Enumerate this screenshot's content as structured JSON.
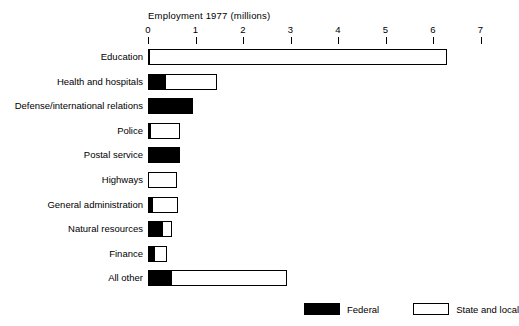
{
  "chart_data": {
    "type": "bar",
    "orientation": "horizontal",
    "stacked": true,
    "title": "Employment 1977 (millions)",
    "xlabel": "",
    "ylabel": "",
    "xlim": [
      0,
      7
    ],
    "xticks": [
      0,
      1,
      2,
      3,
      4,
      5,
      6,
      7
    ],
    "xtick_labels": [
      "0",
      "1",
      "2",
      "3",
      "4",
      "5",
      "6",
      "7"
    ],
    "grid": false,
    "legend_position": "bottom-right",
    "categories": [
      "Education",
      "Health and hospitals",
      "Defense/international relations",
      "Police",
      "Postal service",
      "Highways",
      "General administration",
      "Natural resources",
      "Finance",
      "All other"
    ],
    "series": [
      {
        "name": "Federal",
        "color": "#000000",
        "values": [
          0.02,
          0.36,
          0.95,
          0.05,
          0.68,
          0.0,
          0.09,
          0.32,
          0.15,
          0.5
        ]
      },
      {
        "name": "State and local",
        "color": "#ffffff",
        "values": [
          6.28,
          1.09,
          0.0,
          0.63,
          0.0,
          0.6,
          0.54,
          0.18,
          0.25,
          2.43
        ]
      }
    ],
    "totals": [
      6.3,
      1.45,
      0.95,
      0.68,
      0.68,
      0.6,
      0.63,
      0.5,
      0.4,
      2.93
    ]
  },
  "legend": {
    "entries": [
      {
        "label": "Federal",
        "swatch": "filled"
      },
      {
        "label": "State and local",
        "swatch": "hollow"
      }
    ]
  }
}
